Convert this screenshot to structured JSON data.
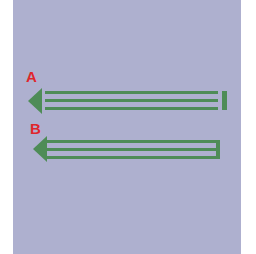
{
  "colors": {
    "background_panel": "#aeb0cf",
    "arrow_green": "#4e8c57",
    "label_red": "#e0262c"
  },
  "figures": [
    {
      "id": "A",
      "label": "A",
      "description": "left-pointing arrow with three parallel shaft lines ending at a separate vertical bar"
    },
    {
      "id": "B",
      "label": "B",
      "description": "left-pointing arrow with three parallel shaft lines joined at the right end"
    }
  ]
}
